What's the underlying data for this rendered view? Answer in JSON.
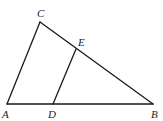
{
  "diagram": {
    "type": "triangle-geometry",
    "points": {
      "A": {
        "label": "A",
        "x": 7,
        "y": 104,
        "lx": 2,
        "ly": 118
      },
      "B": {
        "label": "B",
        "x": 153,
        "y": 104,
        "lx": 151,
        "ly": 118
      },
      "C": {
        "label": "C",
        "x": 40,
        "y": 22,
        "lx": 37,
        "ly": 17
      },
      "D": {
        "label": "D",
        "x": 53,
        "y": 104,
        "lx": 48,
        "ly": 118
      },
      "E": {
        "label": "E",
        "x": 76,
        "y": 49,
        "lx": 78,
        "ly": 46
      }
    },
    "segments": [
      "AC",
      "CB",
      "AB",
      "DE"
    ],
    "line_color": "#1a1a1a"
  }
}
